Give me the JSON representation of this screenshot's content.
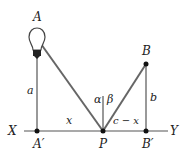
{
  "diagram": {
    "points": {
      "A": {
        "label": "A",
        "x": 37,
        "y": 17
      },
      "A_prime": {
        "label": "A′",
        "x": 38,
        "y": 145
      },
      "B": {
        "label": "B",
        "x": 146,
        "y": 52
      },
      "B_prime": {
        "label": "B′",
        "x": 149,
        "y": 145
      },
      "P": {
        "label": "P",
        "x": 103,
        "y": 145
      },
      "X": {
        "label": "X",
        "x": 14,
        "y": 135
      },
      "Y": {
        "label": "Y",
        "x": 175,
        "y": 135
      }
    },
    "segment_labels": {
      "a": "a",
      "b": "b",
      "x": "x",
      "c_minus_x": "c − x"
    },
    "angle_labels": {
      "alpha": "α",
      "beta": "β"
    },
    "colors": {
      "line": "#555555",
      "ray": "#666666",
      "dot": "#111111",
      "text": "#222222"
    }
  }
}
